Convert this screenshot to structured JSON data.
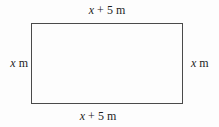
{
  "figure": {
    "type": "geometry-diagram",
    "shape": "rectangle",
    "labels": {
      "top": {
        "variable": "x",
        "rest": "+ 5 m"
      },
      "bottom": {
        "variable": "x",
        "rest": "+ 5 m"
      },
      "left": {
        "variable": "x",
        "rest": "m"
      },
      "right": {
        "variable": "x",
        "rest": "m"
      }
    },
    "colors": {
      "border": "#4a4a4a",
      "text": "#1e1e1e",
      "background": "#fdfdfd"
    }
  }
}
